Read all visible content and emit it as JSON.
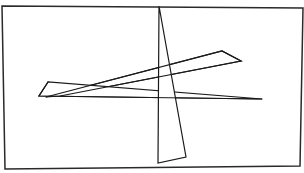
{
  "figure": {
    "colors": {
      "background": "#ffffff",
      "stroke": "#1a1a1a",
      "frame": "#2a2a2a"
    },
    "frame": {
      "points": "2,6 303,8 300,166 5,169"
    },
    "shapes": [
      {
        "name": "rising-wedge",
        "points": "46,97 222,51 241,61 60,96"
      },
      {
        "name": "horizontal-blade",
        "points": "48,82 39,96 262,99"
      },
      {
        "name": "vertical-blade",
        "points": "159,6 158,163 186,157"
      }
    ]
  }
}
